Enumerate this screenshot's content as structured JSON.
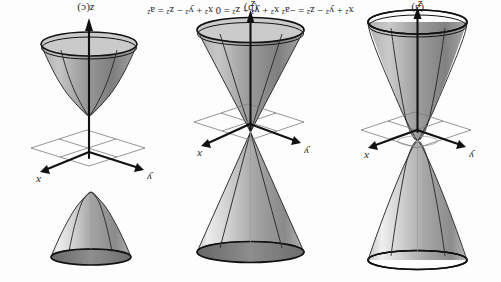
{
  "figure": {
    "kind": "scanned-textbook-figure",
    "orientation": "upside-down-180",
    "page_equation_line": "x² + y² − z² = −a²      x² + y² − z² = 0      x² + y² − z² = a²",
    "ink_color": "#1b1b1b",
    "grid_color": "#7b7b7b",
    "surface_light": "#dcdcdc",
    "surface_dark": "#8a8a8a"
  },
  "panels": [
    {
      "id": "a",
      "caption": "(a)",
      "surface_name": "hyperboloid-of-one-sheet",
      "axes": {
        "x_label": "x",
        "y_label": "y",
        "z_label": "z"
      }
    },
    {
      "id": "b",
      "caption": "(b)",
      "surface_name": "double-cone",
      "axes": {
        "x_label": "x",
        "y_label": "y",
        "z_label": "z"
      }
    },
    {
      "id": "c",
      "caption": "(c)",
      "surface_name": "hyperboloid-of-two-sheets",
      "axes": {
        "x_label": "x",
        "y_label": "y",
        "z_label": "z"
      }
    }
  ]
}
